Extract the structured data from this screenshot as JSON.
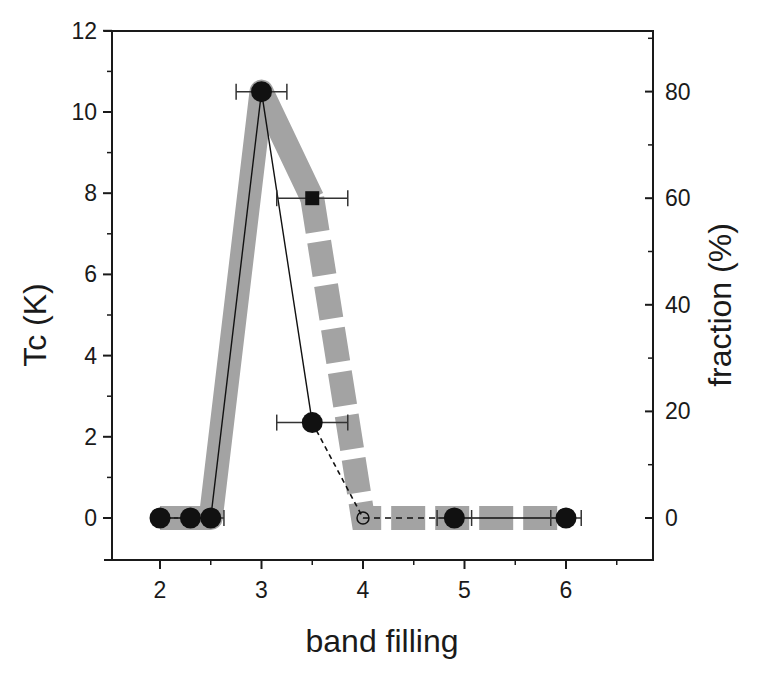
{
  "chart_data": {
    "type": "line",
    "title": "",
    "xlabel": "band filling",
    "ylabel": "Tc (K)",
    "ylabel_right": "fraction (%)",
    "xlim": [
      1.52,
      6.85
    ],
    "ylim": [
      -1,
      12
    ],
    "ylim_right": [
      -7.9,
      90
    ],
    "x_ticks": [
      2,
      3,
      4,
      5,
      6
    ],
    "x_tick_labels": [
      "2",
      "3",
      "4",
      "5",
      "6"
    ],
    "y_ticks": [
      0,
      2,
      4,
      6,
      8,
      10,
      12
    ],
    "y_tick_labels": [
      "0",
      "2",
      "4",
      "6",
      "8",
      "10",
      "12"
    ],
    "y_right_ticks": [
      0,
      20,
      40,
      60,
      80
    ],
    "y_right_tick_labels": [
      "0",
      "20",
      "40",
      "60",
      "80"
    ],
    "grid": false,
    "legend": null,
    "series": [
      {
        "name": "Tc (solid)",
        "axis": "left",
        "style": "solid line, filled circles",
        "x": [
          2.0,
          2.3,
          2.5,
          3.0,
          3.5
        ],
        "values": [
          0,
          0,
          0,
          10.5,
          2.35
        ],
        "x_err": [
          null,
          null,
          0.13,
          0.25,
          0.35
        ]
      },
      {
        "name": "Tc (dashed extrapolation)",
        "axis": "left",
        "style": "dashed line",
        "x": [
          3.5,
          4.0
        ],
        "values": [
          2.35,
          0
        ]
      },
      {
        "name": "Tc (zero, high filling)",
        "axis": "left",
        "style": "dashed then solid line, filled/open circles",
        "x": [
          4.0,
          4.9,
          6.0
        ],
        "values": [
          0,
          0,
          0
        ],
        "markers": [
          "open-circle",
          "filled-circle",
          "filled-circle"
        ],
        "x_err": [
          null,
          0.17,
          0.15
        ]
      },
      {
        "name": "superconducting fraction",
        "axis": "right",
        "style": "thick gray band (solid to x=3.5, dashed after)",
        "x": [
          2.0,
          2.5,
          3.0,
          3.5,
          4.0,
          6.0
        ],
        "values": [
          0,
          0,
          80,
          60,
          0,
          0
        ]
      },
      {
        "name": "fraction point",
        "axis": "right",
        "style": "filled square",
        "x": [
          3.5
        ],
        "values": [
          60
        ],
        "x_err": [
          0.35
        ]
      }
    ]
  },
  "colors": {
    "axis": "#1a1a1a",
    "marker": "#111111",
    "band": "#a3a3a3",
    "background": "#ffffff"
  }
}
